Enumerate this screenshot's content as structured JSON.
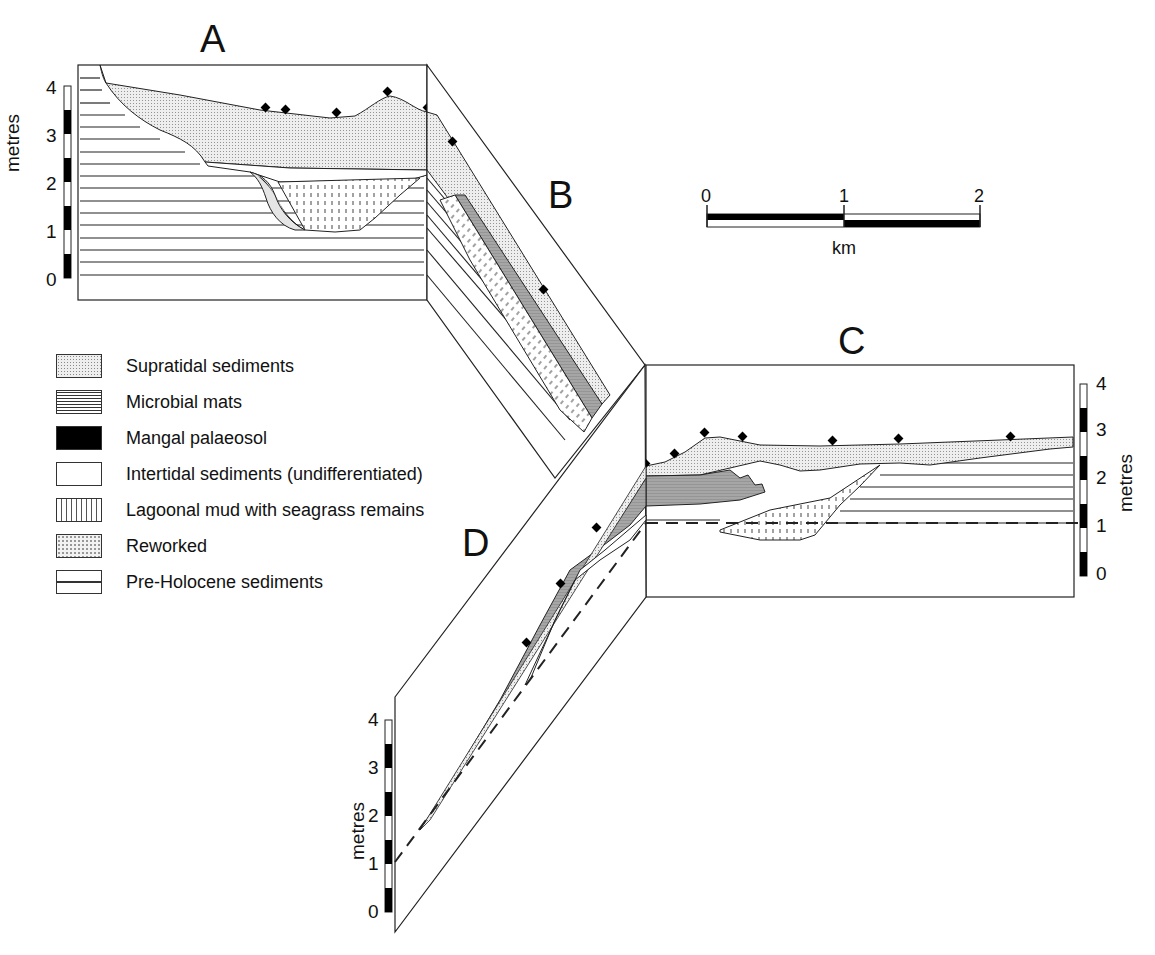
{
  "figure": {
    "sections": [
      {
        "id": "A",
        "label": "A"
      },
      {
        "id": "B",
        "label": "B"
      },
      {
        "id": "C",
        "label": "C"
      },
      {
        "id": "D",
        "label": "D"
      }
    ],
    "vertical_scale": {
      "title": "metres",
      "ticks": [
        "0",
        "1",
        "2",
        "3",
        "4"
      ]
    },
    "horizontal_scale": {
      "unit": "km",
      "ticks": [
        "0",
        "1",
        "2"
      ]
    },
    "legend": [
      {
        "key": "supratidal",
        "label": "Supratidal sediments"
      },
      {
        "key": "microbial",
        "label": "Microbial mats"
      },
      {
        "key": "mangal",
        "label": "Mangal palaeosol"
      },
      {
        "key": "intertidal",
        "label": "Intertidal sediments (undifferentiated)"
      },
      {
        "key": "lagoonal",
        "label": "Lagoonal mud with seagrass remains"
      },
      {
        "key": "reworked",
        "label": "Reworked"
      },
      {
        "key": "preholocene",
        "label": "Pre-Holocene sediments"
      }
    ],
    "colors": {
      "line": "#222222",
      "supratidal_fill": "#e9e9e9",
      "microbial_fill": "#a8a8a8",
      "mangal_fill": "#000000",
      "background": "#ffffff"
    }
  }
}
